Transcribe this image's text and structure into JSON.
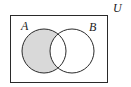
{
  "diagram": {
    "type": "venn",
    "universal_label": "U",
    "sets": [
      {
        "label": "A"
      },
      {
        "label": "B"
      }
    ],
    "shaded_region": "A minus B",
    "colors": {
      "stroke": "#2a2a2a",
      "shade": "#d9d9d9",
      "background": "#ffffff"
    }
  }
}
